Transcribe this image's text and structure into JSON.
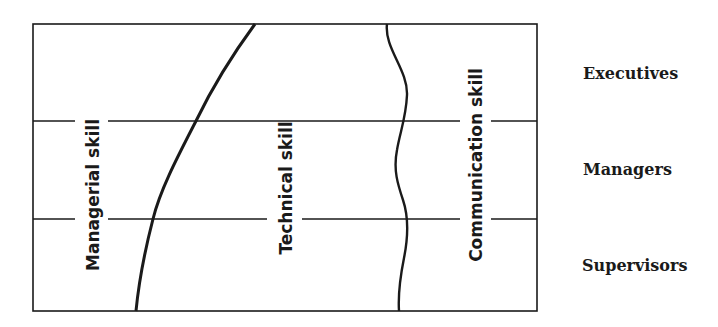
{
  "diagram": {
    "type": "skill-mix-by-management-level",
    "skill_regions": [
      {
        "id": "managerial",
        "label": "Managerial skill"
      },
      {
        "id": "technical",
        "label": "Technical skill"
      },
      {
        "id": "communication",
        "label": "Communication skill"
      }
    ],
    "levels": [
      {
        "id": "executives",
        "label": "Executives"
      },
      {
        "id": "managers",
        "label": "Managers"
      },
      {
        "id": "supervisors",
        "label": "Supervisors"
      }
    ],
    "colors": {
      "line": "#1a1a1a",
      "background": "#ffffff"
    }
  }
}
